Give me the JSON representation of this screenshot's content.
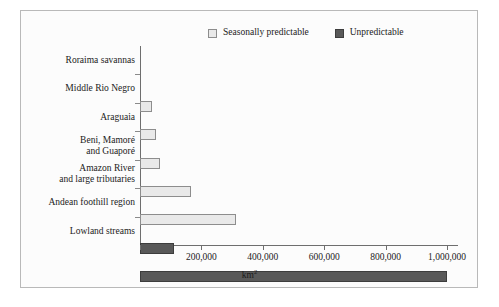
{
  "legend": {
    "entries": [
      {
        "label": "Seasonally predictable",
        "color": "#e9e9e9",
        "border": "#8d8d8d"
      },
      {
        "label": "Unpredictable",
        "color": "#595959",
        "border": "#3d3d3d"
      }
    ]
  },
  "axis": {
    "x_title": "km",
    "x_title_exponent": "2",
    "ticks": [
      "0",
      "200,000",
      "400,000",
      "600,000",
      "800,000",
      "1,000,000"
    ]
  },
  "chart_data": {
    "type": "bar",
    "orientation": "horizontal",
    "title": "",
    "xlabel": "km2",
    "ylabel": "",
    "xlim": [
      0,
      1050000
    ],
    "grid": false,
    "legend_position": "top",
    "categories": [
      "Roraima savannas",
      "Middle Rio Negro",
      "Araguaia",
      "Beni, Mamoré\nand Guaporé",
      "Amazon River\nand large tributaries",
      "Andean foothill region",
      "Lowland streams"
    ],
    "series": [
      {
        "name": "Seasonally predictable",
        "color": "#e9e9e9",
        "values": [
          40000,
          52000,
          65000,
          165000,
          312000,
          null,
          null
        ]
      },
      {
        "name": "Unpredictable",
        "color": "#595959",
        "values": [
          null,
          null,
          null,
          null,
          null,
          110000,
          1000000
        ]
      }
    ],
    "bars": [
      {
        "category": "Roraima savannas",
        "value": 40000,
        "series": "Seasonally predictable"
      },
      {
        "category": "Middle Rio Negro",
        "value": 52000,
        "series": "Seasonally predictable"
      },
      {
        "category": "Araguaia",
        "value": 65000,
        "series": "Seasonally predictable"
      },
      {
        "category": "Beni, Mamoré and Guaporé",
        "value": 165000,
        "series": "Seasonally predictable"
      },
      {
        "category": "Amazon River and large tributaries",
        "value": 312000,
        "series": "Seasonally predictable"
      },
      {
        "category": "Andean foothill region",
        "value": 110000,
        "series": "Unpredictable"
      },
      {
        "category": "Lowland streams",
        "value": 1000000,
        "series": "Unpredictable"
      }
    ]
  }
}
